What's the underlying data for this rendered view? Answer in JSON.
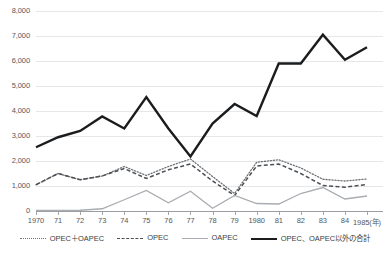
{
  "chart_data": {
    "type": "line",
    "title": "",
    "xlabel": "(年)",
    "ylabel": "",
    "ylim": [
      0,
      8000
    ],
    "ytick_step": 1000,
    "grid": true,
    "legend_position": "bottom",
    "x": [
      1970,
      1971,
      1972,
      1973,
      1974,
      1975,
      1976,
      1977,
      1978,
      1979,
      1980,
      1981,
      1982,
      1983,
      1984,
      1985
    ],
    "xtick_labels": [
      "1970",
      "71",
      "72",
      "73",
      "74",
      "75",
      "76",
      "77",
      "78",
      "79",
      "1980",
      "81",
      "82",
      "83",
      "84",
      "1985(年)"
    ],
    "ytick_labels": [
      "0",
      "1,000",
      "2,000",
      "3,000",
      "4,000",
      "5,000",
      "6,000",
      "7,000",
      "8,000"
    ],
    "series": [
      {
        "name": "OPEC＋OAPEC",
        "style": "dotted",
        "color": "#6f7276",
        "values": [
          1050,
          1500,
          1250,
          1400,
          1780,
          1420,
          1780,
          2080,
          1380,
          700,
          1950,
          2050,
          1720,
          1270,
          1200,
          1280
        ]
      },
      {
        "name": "OPEC",
        "style": "dashed",
        "color": "#4c4f53",
        "values": [
          1050,
          1500,
          1250,
          1400,
          1700,
          1300,
          1650,
          1880,
          1200,
          620,
          1800,
          1880,
          1500,
          1020,
          950,
          1060
        ]
      },
      {
        "name": "OAPEC",
        "style": "solid-light",
        "color": "#a9acb0",
        "values": [
          20,
          20,
          30,
          90,
          450,
          820,
          330,
          790,
          110,
          620,
          300,
          280,
          700,
          940,
          480,
          600
        ]
      },
      {
        "name": "OPEC、OAPEC以外の合計",
        "style": "solid-thick",
        "color": "#1b1c1e",
        "values": [
          2550,
          2950,
          3200,
          3780,
          3300,
          4560,
          3300,
          2180,
          3500,
          4280,
          3800,
          5900,
          5900,
          7050,
          6050,
          6550
        ]
      }
    ]
  },
  "legend": {
    "items": [
      {
        "label": "OPEC＋OAPEC",
        "style": "dotted"
      },
      {
        "label": "OPEC",
        "style": "dashed"
      },
      {
        "label": "OAPEC",
        "style": "solid-light"
      },
      {
        "label": "OPEC、OAPEC以外の合計",
        "style": "solid-thick"
      }
    ]
  },
  "footnote": ""
}
